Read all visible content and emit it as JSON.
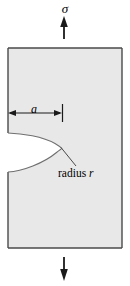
{
  "figure": {
    "name": "edge-notch-plate-under-tension",
    "labels": {
      "stress_top": "σ",
      "crack_length": "a",
      "radius_word": "radius",
      "radius_symbol": "r"
    },
    "colors": {
      "plate_fill": "#e8e8e8",
      "outline": "#4a4a4a",
      "notch_outline": "#777777",
      "arrow": "#1a1a1a",
      "text": "#000000",
      "background": "#ffffff"
    },
    "geometry": {
      "plate_left": 8,
      "plate_right": 122,
      "plate_top": 48,
      "plate_bottom": 248,
      "notch_mouth_top_y": 133,
      "notch_mouth_bottom_y": 172,
      "notch_tip_x": 62,
      "notch_tip_y": 149,
      "dimension_line_y": 113,
      "dimension_tick_x": 62,
      "arrow_axis_x": 64,
      "top_arrow_from_y": 38,
      "top_arrow_to_y": 17,
      "bottom_arrow_from_y": 258,
      "bottom_arrow_to_y": 280
    }
  }
}
